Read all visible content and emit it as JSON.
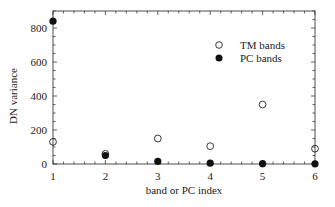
{
  "chart_data": {
    "type": "scatter",
    "title": "",
    "xlabel": "band or PC index",
    "ylabel": "DN variance",
    "x": [
      1,
      2,
      3,
      4,
      5,
      6
    ],
    "xticks": [
      "1",
      "2",
      "3",
      "4",
      "5",
      "6"
    ],
    "yticks": [
      "0",
      "200",
      "400",
      "600",
      "800"
    ],
    "xlim": [
      1,
      6
    ],
    "ylim": [
      0,
      900
    ],
    "grid": false,
    "legend_position": "upper right",
    "series": [
      {
        "name": "TM bands",
        "marker": "open-circle",
        "values": [
          130,
          60,
          150,
          105,
          350,
          90
        ]
      },
      {
        "name": "PC bands",
        "marker": "filled-circle",
        "values": [
          840,
          50,
          15,
          5,
          2,
          1
        ]
      }
    ]
  },
  "colors": {
    "axis": "#222222",
    "marker": "#111111",
    "background": "#ffffff"
  }
}
